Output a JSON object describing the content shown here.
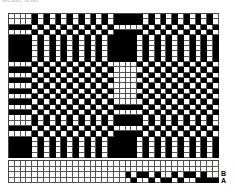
{
  "caption": "weave draft",
  "drawdown": {
    "columns": 36,
    "rows": [
      "0000101010101010101111101010101010100000",
      "0000101010101010101111101010101010100000",
      "1111010101010101010000010101010101011111",
      "0000101010101010101111101010101010100000",
      "1111010101010101011111010101010101011111",
      "1111010101010101011111010101010101011111",
      "1111010101010101011111010101010101011111",
      "1111010101010101011111010101010101011111",
      "1111010101010101011111010101010101011111",
      "0000101010101010100000101010101010100000",
      "1111010101010101010000010101010101011111",
      "0000101010101010100000101010101010100000",
      "1111010101010101010000010101010101011111",
      "0000101010101010100000101010101010100000",
      "1111010101010101010000010101010101011111",
      "0000101010101010100000101010101010100000",
      "1111010101010101010000010101010101011111",
      "0000101010101010101111101010101010100000",
      "1111010101010101010000010101010101011111",
      "0000101010101010101111101010101010100000",
      "0000101010101010101111101010101010100000",
      "1111010101010101010000010101010101011111",
      "0000101010101010101111101010101010100000",
      "1111010101010101011111010101010101011111",
      "1111010101010101011111010101010101011111",
      "1111010101010101011111010101010101011111",
      "1111010101010101011111010101010101011111"
    ]
  },
  "threading": {
    "rows": [
      {
        "label": "",
        "cells": "000000000000000000000000000000000000"
      },
      {
        "label": "",
        "cells": "000000000000000000000000000000000000"
      },
      {
        "label": "B",
        "cells": "000000000000000000001011010010110100"
      },
      {
        "label": "A",
        "cells": "000000000000000000000100101101001111"
      }
    ]
  },
  "labels": {
    "b": "B",
    "a": "A"
  }
}
